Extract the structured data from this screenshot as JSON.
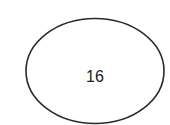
{
  "diagram": {
    "node": {
      "shape": "ellipse",
      "label": "16",
      "stroke_color": "#2a2a2a",
      "fill_color": "#ffffff"
    }
  }
}
